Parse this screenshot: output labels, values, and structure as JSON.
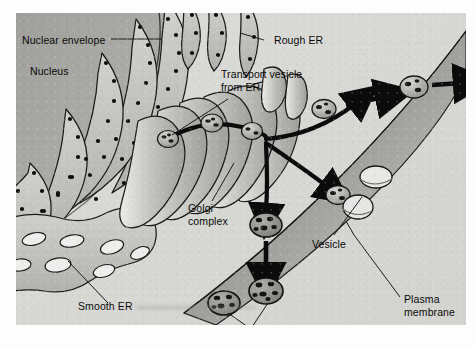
{
  "figure": {
    "background_color": "#d9d9d6"
  },
  "labels": [
    {
      "id": "nuclear-envelope",
      "text": "Nuclear envelope",
      "x": 6,
      "y": 21,
      "align": "left"
    },
    {
      "id": "nucleus",
      "text": "Nucleus",
      "x": 14,
      "y": 52,
      "align": "left"
    },
    {
      "id": "rough-er",
      "text": "Rough ER",
      "x": 258,
      "y": 21,
      "align": "left"
    },
    {
      "id": "transport-vesicle",
      "text": "Transport vesicle\nfrom ER",
      "x": 205,
      "y": 55,
      "align": "left"
    },
    {
      "id": "golgi-complex",
      "text": "Golgi\ncomplex",
      "x": 172,
      "y": 189,
      "align": "left"
    },
    {
      "id": "vesicle",
      "text": "Vesicle",
      "x": 296,
      "y": 225,
      "align": "left"
    },
    {
      "id": "lysosomes",
      "text": "Lysosomes",
      "x": 196,
      "y": 316,
      "align": "left"
    },
    {
      "id": "smooth-er",
      "text": "Smooth ER",
      "x": 62,
      "y": 287,
      "align": "left"
    },
    {
      "id": "plasma-membrane",
      "text": "Plasma\nmembrane",
      "x": 388,
      "y": 280,
      "align": "left"
    }
  ],
  "structures": {
    "nucleus_label": "Nucleus",
    "nuclear_envelope_label": "Nuclear envelope",
    "rough_er_label": "Rough ER",
    "smooth_er_label": "Smooth ER",
    "golgi_label": "Golgi complex",
    "lysosome_label": "Lysosomes",
    "vesicle_label": "Vesicle",
    "plasma_membrane_label": "Plasma membrane",
    "transport_vesicle_label": "Transport vesicle from ER"
  },
  "colors": {
    "cytoplasm": "#d9d9d6",
    "nucleus": "#a8a8a4",
    "membrane_stroke": "#161616",
    "er_fill": "#c4c4c0",
    "er_light": "#ececeb",
    "golgi_fill": "#b8b8b4",
    "golgi_light": "#e4e4e2",
    "lysosome_fill": "#8f8f8b",
    "ribosome": "#101010",
    "arrow": "#0b0b0b",
    "leader": "#1a1a1a",
    "plasma_membrane": "#b4b4b0"
  },
  "counts": {
    "transport_vesicles_on_path": 3,
    "lysosomes_labeled": 2,
    "golgi_cisternae": 7
  }
}
